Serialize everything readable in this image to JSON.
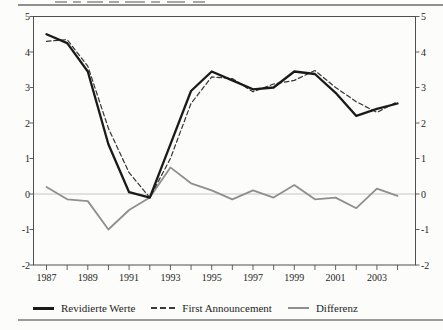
{
  "figure": {
    "kind": "scanned line chart figure, caption cropped at top edge",
    "legend_labels": [
      "Revidierte Werte",
      "First Announcement",
      "Differenz"
    ]
  },
  "chart_data": {
    "type": "line",
    "title": "",
    "xlabel": "",
    "ylabel": "",
    "x_years": [
      1987,
      1988,
      1989,
      1990,
      1991,
      1992,
      1993,
      1994,
      1995,
      1996,
      1997,
      1998,
      1999,
      2000,
      2001,
      2002,
      2003,
      2004
    ],
    "xtick_labels": [
      "1987",
      "1989",
      "1991",
      "1993",
      "1995",
      "1997",
      "1999",
      "2001",
      "2003"
    ],
    "yticks": [
      5,
      4,
      3,
      2,
      1,
      0,
      -1,
      -2
    ],
    "ylim": [
      -2,
      5
    ],
    "dual_axis_labels": true,
    "grid": {
      "zero_line": true,
      "zero_line_color": "#c6c6c6"
    },
    "frame_color": "#4f4f4f",
    "text_color": "#1e1e1e",
    "legend_position": "bottom",
    "series": [
      {
        "name": "Revidierte Werte",
        "line_style": "solid-thick",
        "color": "#1a1a1a",
        "values": [
          4.5,
          4.25,
          3.45,
          1.4,
          0.05,
          -0.1,
          1.4,
          2.9,
          3.45,
          3.2,
          2.95,
          3.0,
          3.45,
          3.38,
          2.85,
          2.2,
          2.4,
          2.55
        ]
      },
      {
        "name": "First Announcement",
        "line_style": "dashed",
        "color": "#333333",
        "values": [
          4.3,
          4.35,
          3.6,
          1.85,
          0.6,
          -0.1,
          1.0,
          2.55,
          3.3,
          3.25,
          2.88,
          3.1,
          3.2,
          3.48,
          3.0,
          2.6,
          2.3,
          2.6
        ]
      },
      {
        "name": "Differenz",
        "line_style": "solid-gray",
        "color": "#8f8f8f",
        "values": [
          0.2,
          -0.15,
          -0.2,
          -1.0,
          -0.45,
          -0.1,
          0.75,
          0.3,
          0.1,
          -0.15,
          0.1,
          -0.1,
          0.25,
          -0.15,
          -0.1,
          -0.4,
          0.15,
          -0.05
        ]
      }
    ]
  }
}
